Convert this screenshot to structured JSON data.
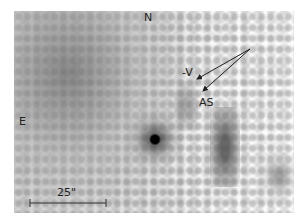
{
  "image": {
    "description": "Grayscale astronomical field image with orientation labels, annotation arrows and scale bar",
    "colors": {
      "background": "#ffffff",
      "field_dark": "#6e6e6e",
      "source": "#000000",
      "annotation": "#222222"
    }
  },
  "labels": {
    "north": "N",
    "east": "E",
    "velocity": "-V",
    "antisolar": "AS"
  },
  "scale_bar": {
    "label": "25\"",
    "length_px": 76
  },
  "arrows": [
    {
      "name": "velocity-arrow",
      "target": "-V"
    },
    {
      "name": "antisolar-arrow",
      "target": "AS"
    }
  ]
}
